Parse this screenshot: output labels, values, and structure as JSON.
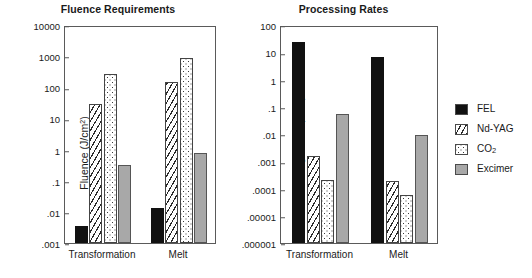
{
  "figure": {
    "panels": [
      "Fluence Requirements",
      "Processing Rates"
    ],
    "categories": [
      "Transformation",
      "Melt"
    ],
    "legend": {
      "items": [
        {
          "label": "FEL",
          "pattern": "solid-black",
          "color": "#111111"
        },
        {
          "label": "Nd-YAG",
          "pattern": "diagonal-hatch",
          "color": "#2a2a2a"
        },
        {
          "label": "CO2",
          "label_display": "CO₂",
          "pattern": "dotted",
          "color": "#3a3a3a"
        },
        {
          "label": "Excimer",
          "pattern": "solid-gray",
          "color": "#a8a8a8"
        }
      ]
    }
  },
  "chart_data": [
    {
      "type": "bar",
      "title": "Fluence Requirements",
      "xlabel": "",
      "ylabel": "Fluence (J/cm²)",
      "yscale": "log",
      "ylim": [
        0.001,
        10000
      ],
      "yticks": [
        "10000",
        "1000",
        "100",
        "10",
        "1",
        ".1",
        ".01",
        ".001"
      ],
      "ytick_values": [
        10000,
        1000,
        100,
        10,
        1,
        0.1,
        0.01,
        0.001
      ],
      "grid": false,
      "legend_position": "right-outside",
      "categories": [
        "Transformation",
        "Melt"
      ],
      "series": [
        {
          "name": "FEL",
          "values": [
            0.0035,
            0.013
          ]
        },
        {
          "name": "Nd-YAG",
          "values": [
            30,
            150
          ]
        },
        {
          "name": "CO2",
          "values": [
            270,
            900
          ]
        },
        {
          "name": "Excimer",
          "values": [
            0.32,
            0.8
          ]
        }
      ]
    },
    {
      "type": "bar",
      "title": "Processing Rates",
      "xlabel": "",
      "ylabel": "Processing Rates (m²/s)",
      "yscale": "log",
      "ylim": [
        1e-06,
        100
      ],
      "yticks": [
        "100",
        "10",
        "1",
        ".1",
        ".01",
        ".001",
        ".0001",
        ".00001",
        ".000001"
      ],
      "ytick_values": [
        100,
        10,
        1,
        0.1,
        0.01,
        0.001,
        0.0001,
        1e-05,
        1e-06
      ],
      "grid": false,
      "legend_position": "right-outside",
      "categories": [
        "Transformation",
        "Melt"
      ],
      "series": [
        {
          "name": "FEL",
          "values": [
            23,
            6.5
          ]
        },
        {
          "name": "Nd-YAG",
          "values": [
            0.0016,
            0.00019
          ]
        },
        {
          "name": "CO2",
          "values": [
            0.0002,
            6e-05
          ]
        },
        {
          "name": "Excimer",
          "values": [
            0.055,
            0.0095
          ]
        }
      ]
    }
  ]
}
